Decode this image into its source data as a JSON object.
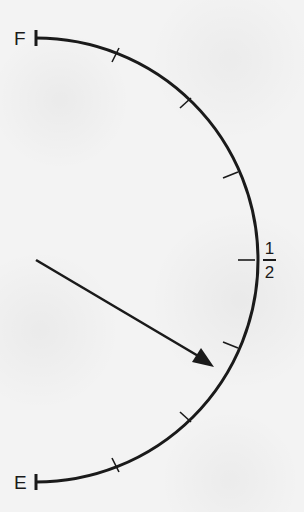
{
  "gauge": {
    "type": "fuel-gauge",
    "full_label": "F",
    "empty_label": "E",
    "half_label": {
      "numerator": "1",
      "denominator": "2"
    },
    "tick_divisions": 8,
    "needle_reading": "slightly above 1/4 (approximately 5/16)",
    "colors": {
      "ink": "#1a1a1a",
      "paper": "#f3f3f3"
    }
  }
}
